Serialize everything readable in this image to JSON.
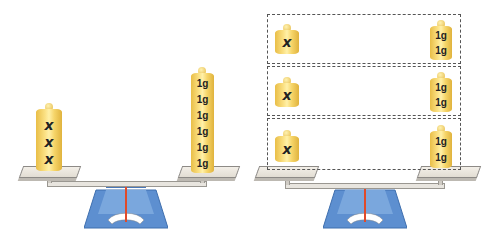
{
  "figure": {
    "left_scale": {
      "left_pan": {
        "weights": [
          "x",
          "x",
          "x"
        ]
      },
      "right_pan": {
        "weights": [
          "1g",
          "1g",
          "1g",
          "1g",
          "1g",
          "1g"
        ]
      }
    },
    "right_scale": {
      "groups": [
        {
          "left": "x",
          "right": [
            "1g",
            "1g"
          ]
        },
        {
          "left": "x",
          "right": [
            "1g",
            "1g"
          ]
        },
        {
          "left": "x",
          "right": [
            "1g",
            "1g"
          ]
        }
      ]
    },
    "colors": {
      "weight": "#f6d569",
      "scale_base": "#5b8fd1",
      "needle": "#e04a2a",
      "pan": "#ebe7e0"
    }
  }
}
